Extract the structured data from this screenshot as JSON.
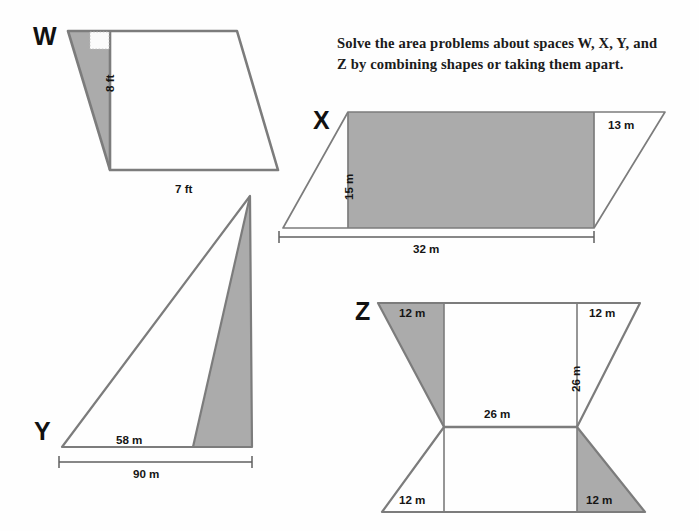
{
  "page": {
    "background_color": "#fefefe",
    "stroke_color": "#7c7c7c",
    "shade_color": "#ababab",
    "text_color": "#151515"
  },
  "instruction": {
    "line1": "Solve the area problems about spaces W, X, Y, and",
    "line2": "Z by combining shapes or taking them apart."
  },
  "shapes": {
    "w": {
      "letter": "W",
      "units": "ft",
      "labels": {
        "height": "8 ft",
        "base": "7 ft"
      }
    },
    "x": {
      "letter": "X",
      "units": "m",
      "labels": {
        "height": "15 m",
        "slant_top_right": "13 m",
        "base": "32 m"
      }
    },
    "y": {
      "letter": "Y",
      "units": "m",
      "labels": {
        "inner_base": "58 m",
        "base": "90 m"
      }
    },
    "z": {
      "letter": "Z",
      "units": "m",
      "labels": {
        "top_left": "12 m",
        "top_right": "12 m",
        "bottom_left": "12 m",
        "bottom_right": "12 m",
        "middle_horizontal": "26 m",
        "right_vertical": "26 m"
      }
    }
  }
}
